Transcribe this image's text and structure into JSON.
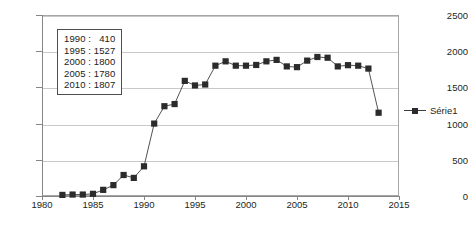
{
  "chart_data": {
    "type": "line",
    "title": "",
    "subtitle": "",
    "xlabel": "",
    "ylabel": "",
    "xlim": [
      1980,
      2015
    ],
    "ylim": [
      0,
      2500
    ],
    "ytick_step": 500,
    "xtick_step": 5,
    "grid": "horizontal",
    "legend_position": "right",
    "marker": "square",
    "marker_color": "#2b2b2b",
    "line_color": "#3f3f3f",
    "ytick_labels": [
      "0",
      "500",
      "1000",
      "1500",
      "2000",
      "2500"
    ],
    "ytick_values": [
      0,
      500,
      1000,
      1500,
      2000,
      2500
    ],
    "xtick_labels": [
      "1980",
      "1985",
      "1990",
      "1995",
      "2000",
      "2005",
      "2010",
      "2015"
    ],
    "xtick_values": [
      1980,
      1985,
      1990,
      1995,
      2000,
      2005,
      2010,
      2015
    ],
    "series": [
      {
        "name": "Série1",
        "x": [
          1982,
          1983,
          1984,
          1985,
          1986,
          1987,
          1988,
          1989,
          1990,
          1991,
          1992,
          1993,
          1994,
          1995,
          1996,
          1997,
          1998,
          1999,
          2000,
          2001,
          2002,
          2003,
          2004,
          2005,
          2006,
          2007,
          2008,
          2009,
          2010,
          2011,
          2012,
          2013
        ],
        "values": [
          15,
          20,
          20,
          30,
          85,
          150,
          290,
          250,
          410,
          1000,
          1240,
          1270,
          1590,
          1527,
          1540,
          1800,
          1860,
          1800,
          1800,
          1810,
          1860,
          1880,
          1790,
          1780,
          1870,
          1920,
          1910,
          1790,
          1807,
          1800,
          1760,
          1150
        ]
      }
    ],
    "annotations": [
      {
        "label": "1990 :",
        "value": "410"
      },
      {
        "label": "1995 :",
        "value": "1527"
      },
      {
        "label": "2000 :",
        "value": "1800"
      },
      {
        "label": "2005 :",
        "value": "1780"
      },
      {
        "label": "2010 :",
        "value": "1807"
      }
    ]
  },
  "legend": {
    "label": "Série1"
  }
}
